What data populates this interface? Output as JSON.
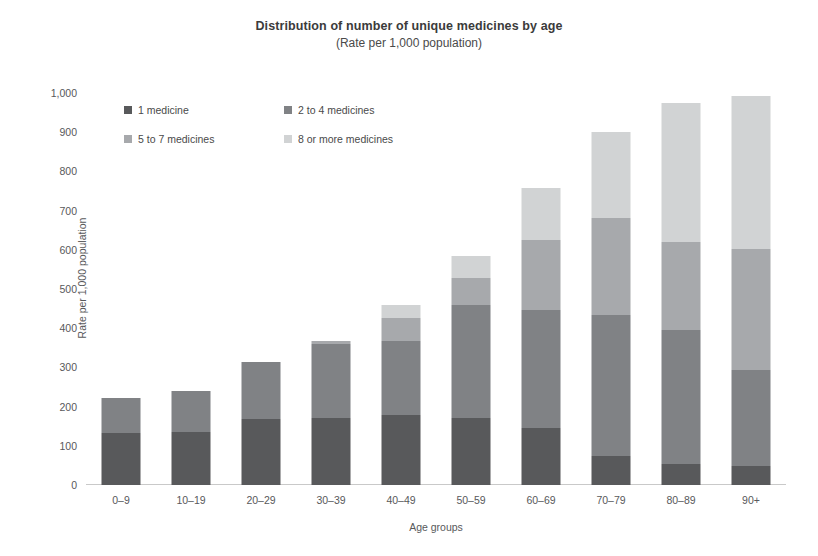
{
  "chart_data": {
    "type": "bar",
    "stacked": true,
    "title": "Distribution of number of unique medicines by age",
    "subtitle": "(Rate per 1,000 population)",
    "xlabel": "Age groups",
    "ylabel": "Rate per 1,000 population",
    "ylim": [
      0,
      1000
    ],
    "yticks": [
      "0",
      "100",
      "200",
      "300",
      "400",
      "500",
      "600",
      "700",
      "800",
      "900",
      "1,000"
    ],
    "ytick_values": [
      0,
      100,
      200,
      300,
      400,
      500,
      600,
      700,
      800,
      900,
      1000
    ],
    "grid": false,
    "legend_position": "upper-left-inside",
    "categories": [
      "0–9",
      "10–19",
      "20–29",
      "30–39",
      "40–49",
      "50–59",
      "60–69",
      "70–79",
      "80–89",
      "90+"
    ],
    "series": [
      {
        "name": "1 medicine",
        "color": "#58595b",
        "values": [
          133,
          134,
          168,
          171,
          178,
          171,
          145,
          74,
          54,
          48
        ]
      },
      {
        "name": "2 to 4 medicines",
        "color": "#808285",
        "values": [
          89,
          106,
          146,
          189,
          189,
          288,
          301,
          360,
          342,
          245
        ]
      },
      {
        "name": "5 to 7 medicines",
        "color": "#a7a9ac",
        "values": [
          0,
          0,
          0,
          8,
          59,
          69,
          179,
          247,
          224,
          309
        ]
      },
      {
        "name": "8 or more medicines",
        "color": "#d1d3d4",
        "values": [
          0,
          0,
          0,
          0,
          33,
          56,
          133,
          219,
          354,
          391
        ]
      }
    ],
    "totals": [
      222,
      240,
      314,
      368,
      459,
      584,
      758,
      900,
      974,
      993
    ]
  },
  "axis_color": "#c9c9c9"
}
